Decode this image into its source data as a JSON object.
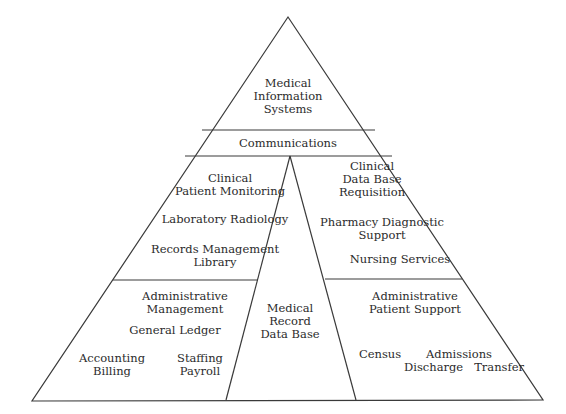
{
  "diagram": {
    "type": "pyramid",
    "apex": {
      "title_lines": [
        "Medical",
        "Information",
        "Systems"
      ]
    },
    "band": {
      "label": "Communications"
    },
    "center_column": {
      "lines": [
        "Medical",
        "Record",
        "Data Base"
      ]
    },
    "upper_left": {
      "heading_lines": [
        "Clinical",
        "Patient Monitoring"
      ],
      "item1": "Laboratory Radiology",
      "item2_lines": [
        "Records Management",
        "Library"
      ]
    },
    "upper_right": {
      "heading_lines": [
        "Clinical",
        "Data Base",
        "Requisition"
      ],
      "item1_lines": [
        "Pharmacy Diagnostic",
        "Support"
      ],
      "item2": "Nursing Services"
    },
    "lower_left": {
      "heading_lines": [
        "Administrative",
        "Management"
      ],
      "item1": "General Ledger",
      "item2_lines": [
        "Accounting",
        "Billing"
      ],
      "item3_lines": [
        "Staffing",
        "Payroll"
      ]
    },
    "lower_right": {
      "heading_lines": [
        "Administrative",
        "Patient Support"
      ],
      "item1": "Census",
      "item2_lines": [
        "Admissions",
        "Discharge   Transfer"
      ]
    },
    "colors": {
      "line": "#3a3a3a",
      "text": "#2b2b2b",
      "background": "#ffffff"
    }
  }
}
